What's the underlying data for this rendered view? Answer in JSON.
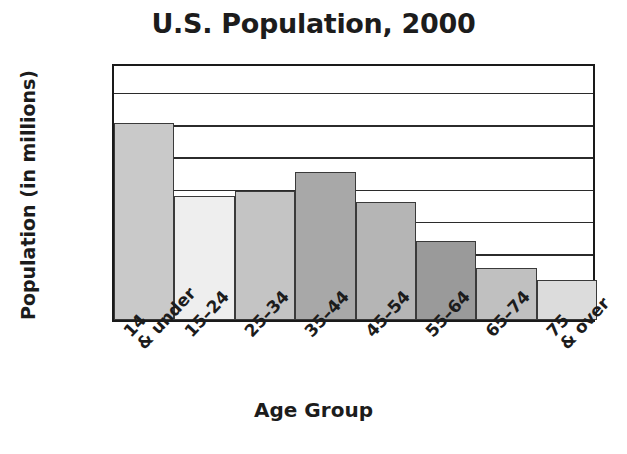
{
  "chart_data": {
    "type": "bar",
    "title": "U.S. Population, 2000",
    "xlabel": "Age Group",
    "ylabel": "Population (in millions)",
    "categories": [
      "14\n& under",
      "15–24",
      "25–34",
      "35–44",
      "45–54",
      "55–64",
      "65–74",
      "75\n& over"
    ],
    "values": [
      61,
      38.5,
      40,
      46,
      36.5,
      24.5,
      16,
      12.5
    ],
    "ylim": [
      0,
      80
    ],
    "yticks": [
      "0",
      "10",
      "20",
      "30",
      "40",
      "50",
      "60",
      "70",
      "80"
    ],
    "ytick_values": [
      0,
      10,
      20,
      30,
      40,
      50,
      60,
      70,
      80
    ],
    "grid": "horizontal",
    "legend": "none",
    "bar_colors": [
      "#c9c9c9",
      "#eeeeee",
      "#c4c4c4",
      "#a8a8a8",
      "#b5b5b5",
      "#9a9a9a",
      "#c0c0c0",
      "#dcdcdc"
    ],
    "axis_color": "#1a1a1a",
    "background": "#ffffff"
  }
}
